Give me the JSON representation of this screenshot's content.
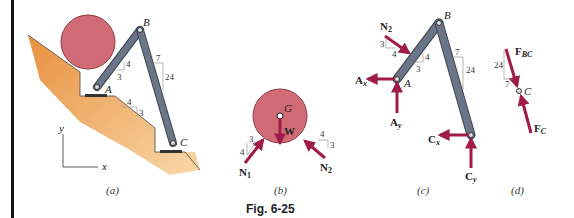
{
  "figure": {
    "caption": "Fig. 6-25",
    "colors": {
      "force": "#a01a4a",
      "member": "#5a6678",
      "member_edge": "#3a4454",
      "disk": "#d06a74",
      "ground": "#e8a050",
      "slope_triangle": "#999999"
    }
  },
  "panels": {
    "a": {
      "caption": "(a)",
      "points": {
        "A": "A",
        "B": "B",
        "C": "C"
      },
      "slopes": [
        {
          "rise": "4",
          "run": "3"
        },
        {
          "rise": "3",
          "run": "4"
        },
        {
          "rise": "24",
          "run": "7"
        }
      ],
      "axes": {
        "x": "x",
        "y": "y"
      }
    },
    "b": {
      "caption": "(b)",
      "center": "G",
      "forces": {
        "W": "W",
        "N1": "N",
        "N1_sub": "1",
        "N2": "N",
        "N2_sub": "2"
      },
      "slopes": [
        {
          "a": "4",
          "b": "3"
        },
        {
          "a": "4",
          "b": "3"
        }
      ]
    },
    "c": {
      "caption": "(c)",
      "points": {
        "A": "A",
        "B": "B"
      },
      "forces": {
        "N2": "N",
        "N2_sub": "2",
        "Ax": "A",
        "Ax_sub": "x",
        "Ay": "A",
        "Ay_sub": "y",
        "Cx": "C",
        "Cx_sub": "x",
        "Cy": "C",
        "Cy_sub": "y"
      },
      "slopes": [
        {
          "a": "3",
          "b": "4"
        },
        {
          "a": "4",
          "b": "3"
        },
        {
          "a": "7",
          "b": "24"
        }
      ]
    },
    "d": {
      "caption": "(d)",
      "point": "C",
      "forces": {
        "FBC": "F",
        "FBC_sub": "BC",
        "FC": "F",
        "FC_sub": "C"
      },
      "slope": {
        "a": "24",
        "b": "7"
      }
    }
  }
}
